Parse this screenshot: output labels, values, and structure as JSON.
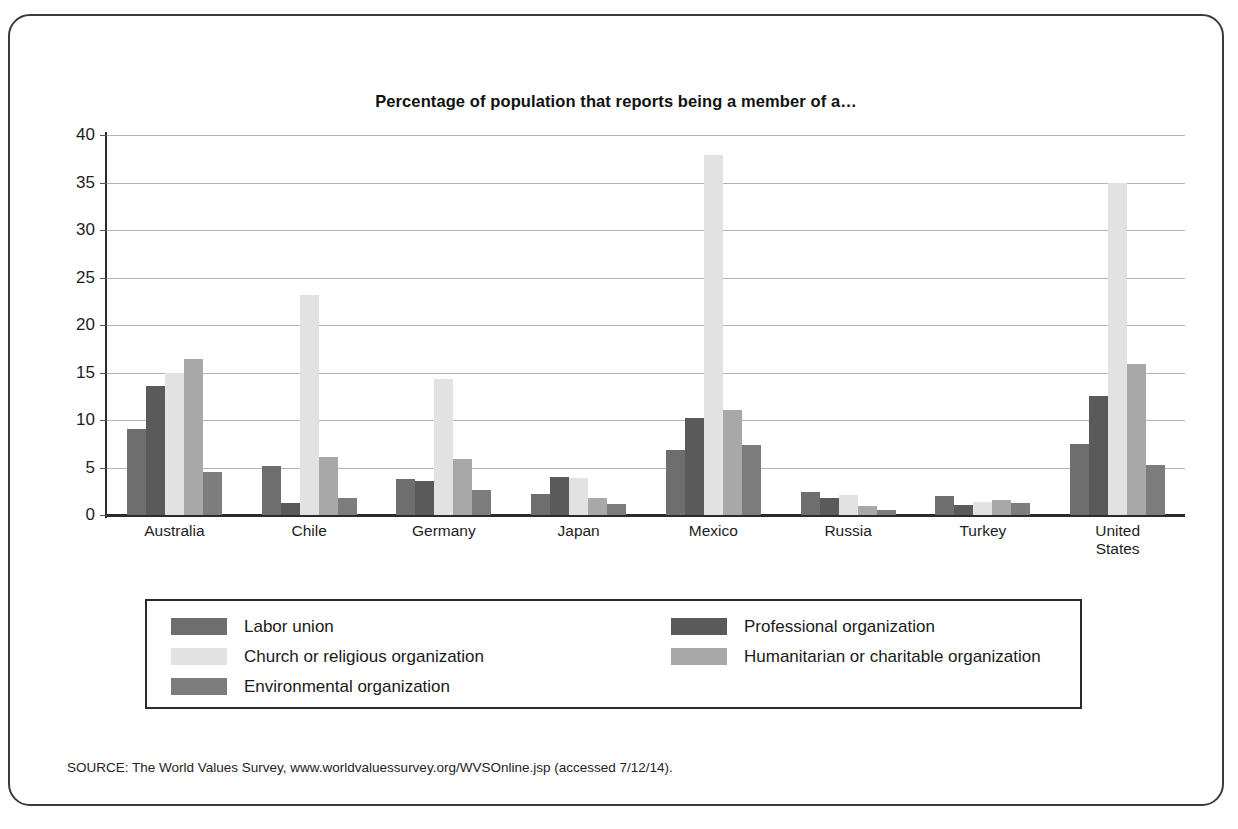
{
  "figure": {
    "title": "Percentage of population that reports being a member of a…",
    "source": "SOURCE: The World Values Survey, www.worldvaluessurvey.org/WVSOnline.jsp (accessed 7/12/14)."
  },
  "legend": {
    "column_a": [
      {
        "label": "Labor union",
        "color": "#6e6e6e"
      },
      {
        "label": "Church or religious organization",
        "color": "#e2e2e2"
      },
      {
        "label": "Environmental organization",
        "color": "#7c7c7c"
      }
    ],
    "column_b": [
      {
        "label": "Professional organization",
        "color": "#5a5a5a"
      },
      {
        "label": "Humanitarian or charitable organization",
        "color": "#a8a8a8"
      }
    ]
  },
  "chart_data": {
    "type": "bar",
    "title": "Percentage of population that reports being a member of a…",
    "xlabel": "",
    "ylabel": "",
    "ylim": [
      0,
      40
    ],
    "yticks": [
      0,
      5,
      10,
      15,
      20,
      25,
      30,
      35,
      40
    ],
    "grid": true,
    "legend_position": "bottom",
    "categories": [
      "Australia",
      "Chile",
      "Germany",
      "Japan",
      "Mexico",
      "Russia",
      "Turkey",
      "United\nStates"
    ],
    "series": [
      {
        "name": "Labor union",
        "color": "#6e6e6e",
        "values": [
          9.1,
          5.2,
          3.8,
          2.2,
          6.8,
          2.4,
          2.0,
          7.5
        ]
      },
      {
        "name": "Professional organization",
        "color": "#5a5a5a",
        "values": [
          13.6,
          1.3,
          3.6,
          4.0,
          10.2,
          1.8,
          1.1,
          12.5
        ]
      },
      {
        "name": "Church or religious organization",
        "color": "#e2e2e2",
        "values": [
          15.0,
          23.2,
          14.3,
          3.9,
          37.9,
          2.1,
          1.4,
          34.9
        ]
      },
      {
        "name": "Humanitarian or charitable organization",
        "color": "#a8a8a8",
        "values": [
          16.4,
          6.1,
          5.9,
          1.8,
          11.1,
          0.9,
          1.6,
          15.9
        ]
      },
      {
        "name": "Environmental organization",
        "color": "#7c7c7c",
        "values": [
          4.5,
          1.8,
          2.6,
          1.2,
          7.4,
          0.5,
          1.3,
          5.3
        ]
      }
    ]
  }
}
